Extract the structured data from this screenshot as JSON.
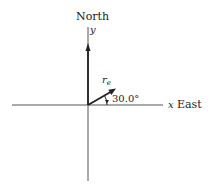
{
  "diagram": {
    "type": "vector-diagram",
    "axes": {
      "north_label": "North",
      "y_label": "y",
      "x_label": "x",
      "east_label": "East"
    },
    "vectors": [
      {
        "name": "north-vector",
        "direction": "North"
      },
      {
        "name": "r_e",
        "label_main": "r",
        "label_sub": "e",
        "angle_from_x_deg": 30.0
      }
    ],
    "angle_label": "30.0°",
    "colors": {
      "line": "#222222",
      "axis": "#555555"
    }
  }
}
